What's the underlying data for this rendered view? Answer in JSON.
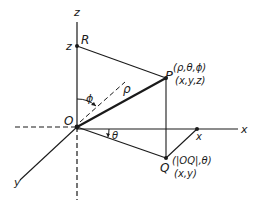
{
  "diagram": {
    "type": "spherical-coordinates",
    "axes": {
      "z_label": "z",
      "x_label": "x",
      "y_label": "y"
    },
    "points": {
      "origin": "O",
      "R": "R",
      "R_tick": "z",
      "P": "P",
      "P_spherical": "(ρ,θ,ϕ)",
      "P_cartesian": "(x,y,z)",
      "Q": "Q",
      "Q_polar": "(|OQ|,θ)",
      "Q_cartesian": "(x,y)",
      "x_tick": "x"
    },
    "angles": {
      "phi": "ϕ",
      "theta": "θ"
    },
    "segment_labels": {
      "rho": "ρ"
    },
    "colors": {
      "line": "#1a1a1a",
      "background": "#ffffff"
    }
  }
}
